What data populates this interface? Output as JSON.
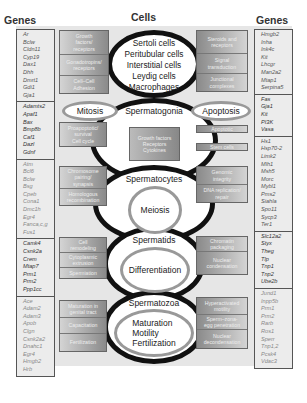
{
  "left_genes": {
    "title": "Genes",
    "groups": [
      {
        "genes": [
          "Ar",
          "Bclw",
          "Cldn11",
          "Cyp19",
          "Dax1",
          "Dhh",
          "Dmrt1",
          "Gdi1",
          "Gja1"
        ]
      },
      {
        "genes": [
          "Adamts2",
          "Apaf1",
          "Bax",
          "Bmp8b",
          "Caf1",
          "Dazl",
          "Gdnf"
        ]
      },
      {
        "genes": [
          "Atm",
          "Bcl6",
          "Bclw",
          "Bsg",
          "Cpeb",
          "Cona1",
          "Dmc1h",
          "Egr4",
          "Fanca,c,g",
          "Fus1"
        ]
      },
      {
        "genes": [
          "Camk4",
          "Csnk2a",
          "Crem",
          "Mtap7",
          "Prm1",
          "Prm2",
          "Ppp1cc"
        ]
      },
      {
        "genes": [
          "Ace",
          "Adam2",
          "Adam3",
          "Apob",
          "Clgn",
          "Csnk2a2",
          "Dnahc1",
          "Egr4",
          "Hmgb2",
          "Hrb"
        ]
      }
    ]
  },
  "right_genes": {
    "title": "Genes",
    "groups": [
      {
        "genes": [
          "Hmgb2",
          "Inha",
          "Ink4c",
          "Kit",
          "Lhcgr",
          "Man2a2",
          "Mtap1",
          "Serpina5"
        ]
      },
      {
        "genes": [
          "Fas",
          "Gja1",
          "Kit",
          "PI3K",
          "Vasa"
        ]
      },
      {
        "genes": [
          "Hs1",
          "Hsp70-2",
          "Limk2",
          "Mlh1",
          "Msh5",
          "Morc",
          "Mybl1",
          "Pms2",
          "Siahla",
          "Spo11",
          "Sycp3",
          "Ter1"
        ]
      },
      {
        "genes": [
          "Slc12a2",
          "Styx",
          "Theg",
          "Tlp",
          "Tnp1",
          "Tnp2",
          "Ube2b"
        ]
      },
      {
        "genes": [
          "Jund1",
          "Inpp5b",
          "Prm1",
          "Prm2",
          "Rarb",
          "Ros1",
          "Sperr",
          "Tnp1,2",
          "Pcsk4",
          "Vdac3"
        ]
      }
    ]
  },
  "cells": {
    "title": "Cells",
    "somatic": [
      "Sertoli cells",
      "Peritubular cells",
      "Interstitial cells",
      "Leydig cells",
      "Macrophages"
    ]
  },
  "stages": {
    "spermatogonia": {
      "name": "Spermatogonia",
      "left_process": "Mitosis",
      "right_process": "Apoptosis",
      "center_box": [
        "Growth factors",
        "Receptors",
        "Cytokines"
      ]
    },
    "spermatocytes": {
      "name": "Spermatocytes",
      "process": "Meiosis"
    },
    "spermatids": {
      "name": "Spermatids",
      "process": "Differentiation"
    },
    "spermatozoa": {
      "name": "Spermatozoa",
      "process": [
        "Maturation",
        "Motility",
        "Fertilization"
      ]
    }
  },
  "left_boxes": {
    "cells": [
      [
        "Growth",
        "factors/",
        "receptors"
      ],
      [
        "Gonadotropins/",
        "receptors"
      ],
      [
        "Cell–Cell",
        "Adhesion"
      ]
    ],
    "spermatogonia": [
      [
        "Proapoptotic/",
        "survival",
        "Cell cycle"
      ]
    ],
    "spermatocytes": [
      [
        "Chromosome",
        "pairing/",
        "synapsis"
      ],
      [
        "Homologous",
        "recombination"
      ]
    ],
    "spermatids": [
      [
        "Cell",
        "remodeling"
      ],
      [
        "Cytoplasmic",
        "extrusion"
      ],
      [
        "Spermiation"
      ]
    ],
    "spermatozoa": [
      [
        "Maturation in",
        "genital tract"
      ],
      [
        "Capacitation"
      ],
      [
        "Fertilization"
      ]
    ]
  },
  "right_boxes": {
    "cells": [
      [
        "Steroids and",
        "receptors"
      ],
      [
        "Signal",
        "transduction"
      ],
      [
        "Junctional",
        "complexes"
      ]
    ],
    "spermatogonia": [
      [
        "Apoptotic"
      ],
      [
        "Stem cells"
      ]
    ],
    "spermatocytes": [
      [
        "Genomic",
        "integrity"
      ],
      [
        "DNA replication/",
        "repair"
      ]
    ],
    "spermatids": [
      [
        "Chromatin",
        "packaging"
      ],
      [
        "Nuclear",
        "condensation"
      ]
    ],
    "spermatozoa": [
      [
        "Hyperactivated",
        "motility"
      ],
      [
        "Sperm–zona-",
        "egg penetration"
      ],
      [
        "Nuclear",
        "decondensation"
      ]
    ]
  }
}
